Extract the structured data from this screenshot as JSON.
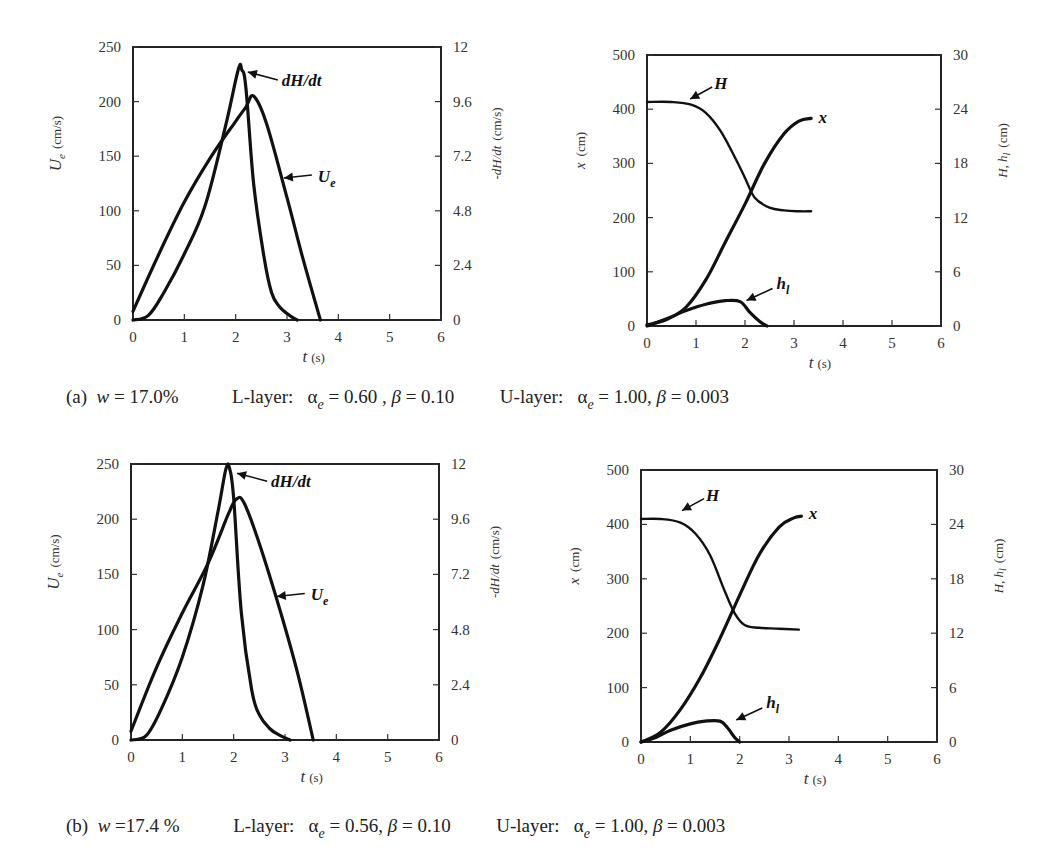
{
  "panels": [
    {
      "id": "a",
      "caption": {
        "tag": "(a)",
        "w_label": "w",
        "w_value": "= 17.0%",
        "l_layer_label": "L-layer:",
        "l_alpha_sym": "α",
        "l_alpha_sub": "e",
        "l_alpha_value": "= 0.60 ,",
        "l_beta_sym": "β",
        "l_beta_value": "= 0.10",
        "u_layer_label": "U-layer:",
        "u_alpha_sym": "α",
        "u_alpha_sub": "e",
        "u_alpha_value": "= 1.00,",
        "u_beta_sym": "β",
        "u_beta_value": "= 0.003"
      }
    },
    {
      "id": "b",
      "caption": {
        "tag": "(b)",
        "w_label": "w",
        "w_value": "=17.4 %",
        "l_layer_label": "L-layer:",
        "l_alpha_sym": "α",
        "l_alpha_sub": "e",
        "l_alpha_value": "= 0.56,",
        "l_beta_sym": "β",
        "l_beta_value": "= 0.10",
        "u_layer_label": "U-layer:",
        "u_alpha_sym": "α",
        "u_alpha_sub": "e",
        "u_alpha_value": "= 1.00,",
        "u_beta_sym": "β",
        "u_beta_value": "= 0.003"
      }
    }
  ],
  "chart_data": [
    {
      "id": "a-left",
      "type": "line",
      "title": "",
      "frame": {
        "x0": 133,
        "x1": 441,
        "y0": 320,
        "y1": 47
      },
      "xlabel": "t (s)",
      "xlim": [
        0,
        6
      ],
      "xticks": [
        0,
        1,
        2,
        3,
        4,
        5,
        6
      ],
      "ylabel": "U_e (cm/s)",
      "ylabel_sym": "U",
      "ylabel_sub": "e",
      "ylabel_unit": "(cm/s)",
      "ylim": [
        0,
        250
      ],
      "yticks": [
        0,
        50,
        100,
        150,
        200,
        250
      ],
      "y2label": "-dH/dt (cm/s)",
      "y2lim": [
        0,
        12
      ],
      "y2ticks": [
        "0",
        "2.4",
        "4.8",
        "7.2",
        "9.6",
        "12"
      ],
      "grid": false,
      "series": [
        {
          "name": "U_e",
          "label": "U",
          "label_sub": "e",
          "axis": "left",
          "x": [
            0,
            0.5,
            1.0,
            1.5,
            2.0,
            2.2,
            2.35,
            2.6,
            3.0,
            3.3,
            3.65
          ],
          "y": [
            8,
            60,
            108,
            148,
            182,
            195,
            205,
            180,
            112,
            58,
            0
          ]
        },
        {
          "name": "dH/dt",
          "label": "dH/dt",
          "axis": "right",
          "x": [
            0,
            0.3,
            0.6,
            1.0,
            1.4,
            1.8,
            2.05,
            2.12,
            2.2,
            2.35,
            2.55,
            2.7,
            2.85,
            3.05,
            3.2
          ],
          "y": [
            0,
            0.2,
            1.2,
            2.9,
            5.0,
            8.5,
            11.0,
            11.0,
            10.2,
            6.0,
            2.8,
            1.2,
            0.6,
            0.2,
            0
          ]
        }
      ],
      "annotations": [
        {
          "text": "dH/dt",
          "arrow_to_x": 2.12,
          "arrow_to_y_right": 10.9
        },
        {
          "text": "U_e",
          "arrow_to_x": 2.9,
          "arrow_to_y_left": 130
        }
      ]
    },
    {
      "id": "a-right",
      "type": "line",
      "title": "",
      "frame": {
        "x0": 647,
        "x1": 941,
        "y0": 326,
        "y1": 55
      },
      "xlabel": "t (s)",
      "xlim": [
        0,
        6
      ],
      "xticks": [
        0,
        1,
        2,
        3,
        4,
        5,
        6
      ],
      "ylabel": "x (cm)",
      "ylim": [
        0,
        500
      ],
      "yticks": [
        0,
        100,
        200,
        300,
        400,
        500
      ],
      "y2label": "H, h_l (cm)",
      "y2lim": [
        0,
        30
      ],
      "y2ticks": [
        "0",
        "6",
        "12",
        "18",
        "24",
        "30"
      ],
      "grid": false,
      "series": [
        {
          "name": "x",
          "label": "x",
          "axis": "left",
          "x": [
            0,
            0.4,
            0.8,
            1.2,
            1.6,
            2.0,
            2.4,
            2.8,
            3.1,
            3.35
          ],
          "y": [
            2,
            12,
            35,
            85,
            155,
            225,
            300,
            355,
            378,
            383
          ]
        },
        {
          "name": "H",
          "label": "H",
          "axis": "right",
          "x": [
            0,
            0.5,
            0.9,
            1.2,
            1.5,
            1.8,
            2.0,
            2.2,
            2.5,
            2.8,
            3.1,
            3.35
          ],
          "y": [
            24.8,
            24.8,
            24.5,
            23.6,
            21.6,
            18.6,
            16.4,
            14.2,
            13.1,
            12.8,
            12.7,
            12.7
          ]
        },
        {
          "name": "h_l",
          "label": "h",
          "label_sub": "l",
          "axis": "right",
          "x": [
            0,
            0.4,
            0.8,
            1.2,
            1.6,
            1.9,
            2.1,
            2.3,
            2.45
          ],
          "y": [
            0,
            0.8,
            1.7,
            2.4,
            2.8,
            2.7,
            1.5,
            0.5,
            0
          ]
        }
      ],
      "annotations": [
        {
          "text": "H",
          "arrow_to_x": 0.8,
          "arrow_to_y_right": 24.9
        },
        {
          "text": "x",
          "near_x": 3.5,
          "near_y_left": 383
        },
        {
          "text": "h_l",
          "arrow_to_x": 1.95,
          "arrow_to_y_right": 2.6
        }
      ]
    },
    {
      "id": "b-left",
      "type": "line",
      "title": "",
      "frame": {
        "x0": 131,
        "x1": 439,
        "y0": 740,
        "y1": 464
      },
      "xlabel": "t (s)",
      "xlim": [
        0,
        6
      ],
      "xticks": [
        0,
        1,
        2,
        3,
        4,
        5,
        6
      ],
      "ylabel": "U_e (cm/s)",
      "ylabel_sym": "U",
      "ylabel_sub": "e",
      "ylabel_unit": "(cm/s)",
      "ylim": [
        0,
        250
      ],
      "yticks": [
        0,
        50,
        100,
        150,
        200,
        250
      ],
      "y2label": "-dH/dt (cm/s)",
      "y2lim": [
        0,
        12
      ],
      "y2ticks": [
        "0",
        "2.4",
        "4.8",
        "7.2",
        "9.6",
        "12"
      ],
      "grid": false,
      "series": [
        {
          "name": "U_e",
          "label": "U",
          "label_sub": "e",
          "axis": "left",
          "x": [
            0,
            0.5,
            1.0,
            1.5,
            1.9,
            2.05,
            2.2,
            2.5,
            2.9,
            3.25,
            3.55
          ],
          "y": [
            8,
            66,
            115,
            160,
            205,
            218,
            215,
            178,
            118,
            60,
            0
          ]
        },
        {
          "name": "dH/dt",
          "label": "dH/dt",
          "axis": "right",
          "x": [
            0,
            0.3,
            0.6,
            1.0,
            1.4,
            1.7,
            1.85,
            1.92,
            2.0,
            2.15,
            2.35,
            2.5,
            2.7,
            2.9,
            3.1
          ],
          "y": [
            0,
            0.2,
            1.4,
            3.6,
            6.7,
            10.0,
            11.8,
            11.8,
            10.5,
            5.5,
            2.2,
            1.1,
            0.5,
            0.2,
            0
          ]
        }
      ],
      "annotations": [
        {
          "text": "dH/dt",
          "arrow_to_x": 1.95,
          "arrow_to_y_right": 11.6
        },
        {
          "text": "U_e",
          "arrow_to_x": 2.8,
          "arrow_to_y_left": 130
        }
      ]
    },
    {
      "id": "b-right",
      "type": "line",
      "title": "",
      "frame": {
        "x0": 641,
        "x1": 937,
        "y0": 742,
        "y1": 470
      },
      "xlabel": "t (s)",
      "xlim": [
        0,
        6
      ],
      "xticks": [
        0,
        1,
        2,
        3,
        4,
        5,
        6
      ],
      "ylabel": "x (cm)",
      "ylim": [
        0,
        500
      ],
      "yticks": [
        0,
        100,
        200,
        300,
        400,
        500
      ],
      "y2label": "H, h_l (cm)",
      "y2lim": [
        0,
        30
      ],
      "y2ticks": [
        "0",
        "6",
        "12",
        "18",
        "24",
        "30"
      ],
      "grid": false,
      "series": [
        {
          "name": "x",
          "label": "x",
          "axis": "left",
          "x": [
            0,
            0.4,
            0.8,
            1.2,
            1.6,
            2.0,
            2.4,
            2.8,
            3.1,
            3.25
          ],
          "y": [
            0,
            18,
            60,
            118,
            190,
            270,
            345,
            395,
            412,
            415
          ]
        },
        {
          "name": "H",
          "label": "H",
          "axis": "right",
          "x": [
            0,
            0.4,
            0.8,
            1.1,
            1.4,
            1.7,
            1.9,
            2.1,
            2.4,
            2.8,
            3.2
          ],
          "y": [
            24.6,
            24.6,
            24.2,
            23.0,
            20.6,
            16.6,
            14.2,
            12.9,
            12.6,
            12.5,
            12.4
          ]
        },
        {
          "name": "h_l",
          "label": "h",
          "label_sub": "l",
          "axis": "right",
          "x": [
            0,
            0.3,
            0.6,
            1.0,
            1.3,
            1.6,
            1.75,
            1.9,
            2.0
          ],
          "y": [
            0,
            0.5,
            1.3,
            2.0,
            2.3,
            2.3,
            1.6,
            0.5,
            0
          ]
        }
      ],
      "annotations": [
        {
          "text": "H",
          "arrow_to_x": 0.75,
          "arrow_to_y_right": 25.3
        },
        {
          "text": "x",
          "near_x": 3.4,
          "near_y_left": 420
        },
        {
          "text": "h_l",
          "arrow_to_x": 1.85,
          "arrow_to_y_right": 2.2
        }
      ]
    }
  ]
}
